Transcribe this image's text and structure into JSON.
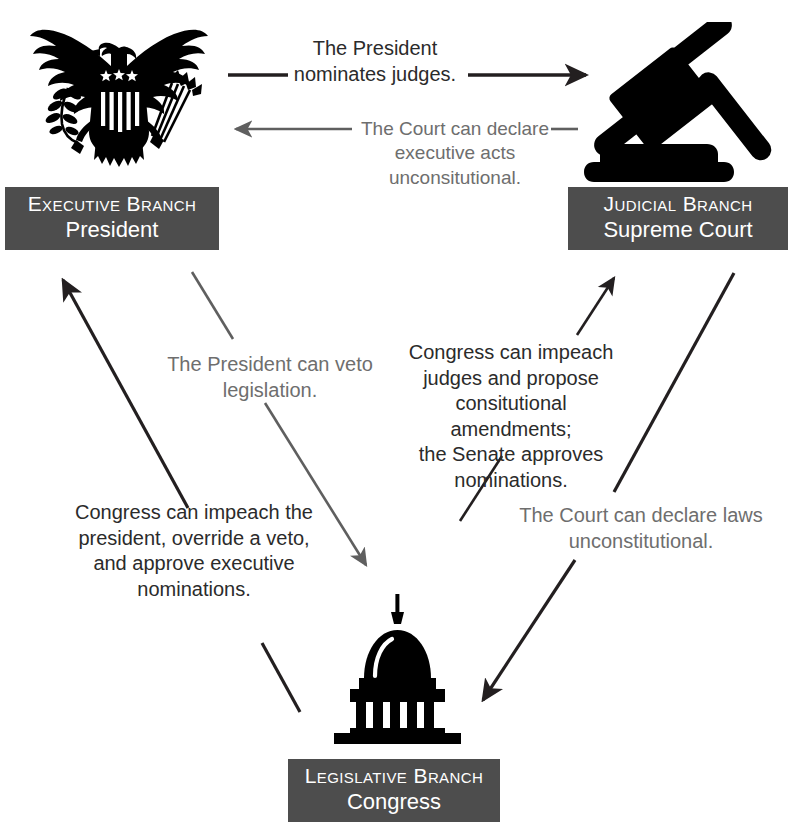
{
  "diagram": {
    "background_color": "#ffffff",
    "plate_color": "#4d4d4d",
    "plate_text_color": "#ffffff",
    "arrow_dark_color": "#231f20",
    "arrow_gray_color": "#6e6e6e",
    "icon_color": "#000000"
  },
  "nodes": {
    "executive": {
      "icon": "eagle-seal-icon",
      "branch": "Executive Branch",
      "office": "President"
    },
    "judicial": {
      "icon": "gavel-icon",
      "branch": "Judicial Branch",
      "office": "Supreme Court"
    },
    "legislative": {
      "icon": "capitol-building-icon",
      "branch": "Legislative Branch",
      "office": "Congress"
    }
  },
  "connections": [
    {
      "id": "president-nominates-judges",
      "from": "executive",
      "to": "judicial",
      "tone": "dark",
      "lines": [
        "The President",
        "nominates judges."
      ]
    },
    {
      "id": "court-declares-executive-acts-unconstitutional",
      "from": "judicial",
      "to": "executive",
      "tone": "gray",
      "lines": [
        "The Court can declare",
        "executive acts",
        "unconsitutional."
      ]
    },
    {
      "id": "president-vetoes-legislation",
      "from": "executive",
      "to": "legislative",
      "tone": "gray",
      "lines": [
        "The President can veto",
        "legislation."
      ]
    },
    {
      "id": "congress-checks-president",
      "from": "legislative",
      "to": "executive",
      "tone": "dark",
      "lines": [
        "Congress can impeach the",
        "president, override a veto,",
        "and approve executive",
        "nominations."
      ]
    },
    {
      "id": "congress-checks-courts",
      "from": "legislative",
      "to": "judicial",
      "tone": "dark",
      "lines": [
        "Congress can impeach",
        "judges and propose",
        "consitutional amendments;",
        "the Senate approves",
        "nominations."
      ]
    },
    {
      "id": "court-declares-laws-unconstitutional",
      "from": "judicial",
      "to": "legislative",
      "tone": "gray",
      "lines": [
        "The Court can declare laws",
        "unconstitutional."
      ]
    }
  ]
}
